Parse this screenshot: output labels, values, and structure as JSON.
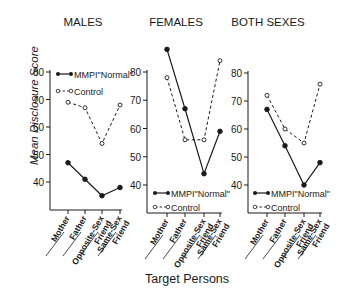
{
  "chart_data": [
    {
      "type": "line",
      "title": "MALES",
      "categories": [
        "Mother",
        "Father",
        "Opposite-Sex Friend",
        "Same-Sex Friend"
      ],
      "series": [
        {
          "name": "MMPI \"Normal\"",
          "style": "solid-filled",
          "values": [
            47,
            41,
            35,
            38
          ]
        },
        {
          "name": "Control",
          "style": "dashed-open",
          "values": [
            69,
            67,
            54,
            68
          ]
        }
      ],
      "ylabel": "Mean Disclosure Score",
      "yticks": [
        40,
        50,
        60,
        70,
        80
      ],
      "ylim": [
        30,
        80
      ],
      "legend_position": "top-left"
    },
    {
      "type": "line",
      "title": "FEMALES",
      "categories": [
        "Mother",
        "Father",
        "Opposite-Sex Friend",
        "Same-Sex Friend"
      ],
      "series": [
        {
          "name": "MMPI \"Normal\"",
          "style": "solid-filled",
          "values": [
            88,
            67,
            44,
            59
          ]
        },
        {
          "name": "Control",
          "style": "dashed-open",
          "values": [
            78,
            56,
            56,
            84
          ]
        }
      ],
      "yticks": [
        40,
        50,
        60,
        70,
        80
      ],
      "ylim": [
        30,
        80
      ],
      "legend_position": "bottom-left"
    },
    {
      "type": "line",
      "title": "BOTH SEXES",
      "categories": [
        "Mother",
        "Father",
        "Opposite-Sex Friend",
        "Same-Sex Friend"
      ],
      "series": [
        {
          "name": "MMPI \"Normal\"",
          "style": "solid-filled",
          "values": [
            67,
            54,
            40,
            48
          ]
        },
        {
          "name": "Control",
          "style": "dashed-open",
          "values": [
            72,
            60,
            55,
            76
          ]
        }
      ],
      "yticks": [
        40,
        50,
        60,
        70,
        80
      ],
      "ylim": [
        30,
        80
      ],
      "legend_position": "bottom-left"
    }
  ],
  "xlabel": "Target Persons",
  "ylabel": "Mean Disclosure Score",
  "legend": {
    "mmpi": "MMPI\"Normal\"",
    "control": "Control"
  },
  "tick_labels": [
    "Mother",
    "Father",
    "Opposite-Sex",
    "Friend",
    "Same-Sex",
    "Friend"
  ],
  "colors": {
    "ink": "#1a1a1a",
    "background": "#ffffff"
  }
}
